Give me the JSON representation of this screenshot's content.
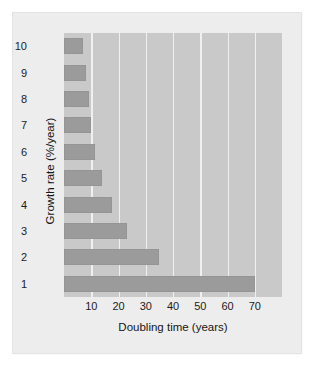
{
  "figure": {
    "card_background": "#ededed",
    "plot_background": "#c9c9c9",
    "bar_color": "#9b9b9b",
    "gridline_color": "#f2f2f2"
  },
  "chart_data": {
    "type": "bar",
    "orientation": "horizontal",
    "title": "",
    "xlabel": "Doubling time (years)",
    "ylabel": "Growth rate (%/year)",
    "categories": [
      "10",
      "9",
      "8",
      "7",
      "6",
      "5",
      "4",
      "3",
      "2",
      "1"
    ],
    "values": [
      7,
      8,
      9,
      10,
      11.5,
      14,
      17.5,
      23,
      35,
      70
    ],
    "xlim": [
      0,
      80
    ],
    "ylim": [
      0,
      10
    ],
    "xticks": [
      10,
      20,
      30,
      40,
      50,
      60,
      70
    ],
    "xticklabels": [
      "10",
      "20",
      "30",
      "40",
      "50",
      "60",
      "70"
    ],
    "yticklabels": [
      "10",
      "9",
      "8",
      "7",
      "6",
      "5",
      "4",
      "3",
      "2",
      "1"
    ],
    "grid": "vertical",
    "legend": "none",
    "series": [
      {
        "name": "Doubling time",
        "values": [
          7,
          8,
          9,
          10,
          11.5,
          14,
          17.5,
          23,
          35,
          70
        ]
      }
    ]
  }
}
